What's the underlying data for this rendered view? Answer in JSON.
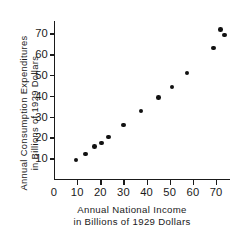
{
  "chart_data": {
    "type": "scatter",
    "title": "",
    "xlabel": "Annual National Income in Billions of 1929 Dollars",
    "ylabel": "Annual Consumption Expenditures in Billions of 1929 Dollars",
    "xlabel_lines": [
      "Annual National Income",
      "in Billions of 1929 Dollars"
    ],
    "ylabel_lines": [
      "Annual Consumption Expenditures",
      "in Billions of 1929 Dollars"
    ],
    "xlim": [
      0,
      76
    ],
    "ylim": [
      0,
      76
    ],
    "xticks": [
      0,
      10,
      20,
      30,
      40,
      50,
      60,
      70
    ],
    "yticks": [
      10,
      20,
      30,
      40,
      50,
      60,
      70
    ],
    "xtick_labels": [
      "0",
      "10",
      "20",
      "30",
      "40",
      "50",
      "60",
      "70"
    ],
    "ytick_labels": [
      "10",
      "20",
      "30",
      "40",
      "50",
      "60",
      "70"
    ],
    "grid": false,
    "legend": null,
    "marker": "filled-circle",
    "marker_color": "#111111",
    "points": [
      {
        "x": 9.5,
        "y": 9.2
      },
      {
        "x": 13.5,
        "y": 12.0
      },
      {
        "x": 17.5,
        "y": 15.6
      },
      {
        "x": 20.5,
        "y": 17.4
      },
      {
        "x": 23.5,
        "y": 20.3
      },
      {
        "x": 30.0,
        "y": 26.0
      },
      {
        "x": 37.5,
        "y": 32.7
      },
      {
        "x": 45.0,
        "y": 39.2
      },
      {
        "x": 51.0,
        "y": 44.2
      },
      {
        "x": 57.5,
        "y": 51.0
      },
      {
        "x": 69.0,
        "y": 63.0
      },
      {
        "x": 72.0,
        "y": 72.0
      },
      {
        "x": 73.5,
        "y": 69.3
      }
    ]
  }
}
